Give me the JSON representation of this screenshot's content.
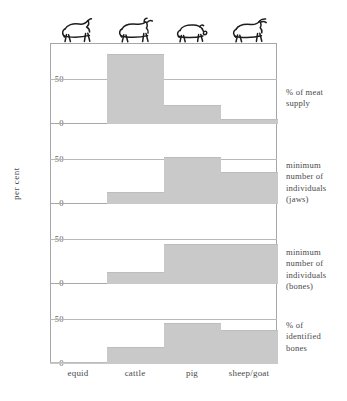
{
  "chart_data": {
    "type": "bar",
    "title": "",
    "subtitle": "",
    "xlabel": "",
    "ylabel": "per cent",
    "categories": [
      "equid",
      "cattle",
      "pig",
      "sheep/goat"
    ],
    "grid": true,
    "legend": "none",
    "ylim": [
      0,
      85
    ],
    "yticks": [
      0,
      50
    ],
    "ytick_labels": [
      "0",
      "50"
    ],
    "panels": [
      {
        "id": "meat-supply",
        "label": "% of meat supply",
        "label_lines": [
          "% of meat",
          "supply"
        ],
        "values": [
          0,
          78,
          20,
          5
        ]
      },
      {
        "id": "mni-jaws",
        "label": "minimum number of individuals (jaws)",
        "label_lines": [
          "minimum",
          "number of",
          "individuals",
          "(jaws)"
        ],
        "values": [
          0,
          13,
          52,
          35
        ]
      },
      {
        "id": "mni-bones",
        "label": "minimum number of individuals (bones)",
        "label_lines": [
          "minimum",
          "number of",
          "individuals",
          "(bones)"
        ],
        "values": [
          0,
          12,
          44,
          44
        ]
      },
      {
        "id": "identified-bones",
        "label": "% of identified bones",
        "label_lines": [
          "% of",
          "identified",
          "bones"
        ],
        "values": [
          1,
          18,
          46,
          38
        ]
      }
    ],
    "icons": [
      "horse-icon",
      "cattle-icon",
      "pig-icon",
      "sheep-goat-icon"
    ],
    "colors": {
      "bar_fill": "#c9c9c9",
      "gridline": "#b9b9b9",
      "frame": "#a7a7a7",
      "text": "#4a4a4a",
      "background": "#ffffff"
    }
  },
  "axis": {
    "ylabel": "per cent",
    "tick_50": "50",
    "tick_0": "0"
  }
}
